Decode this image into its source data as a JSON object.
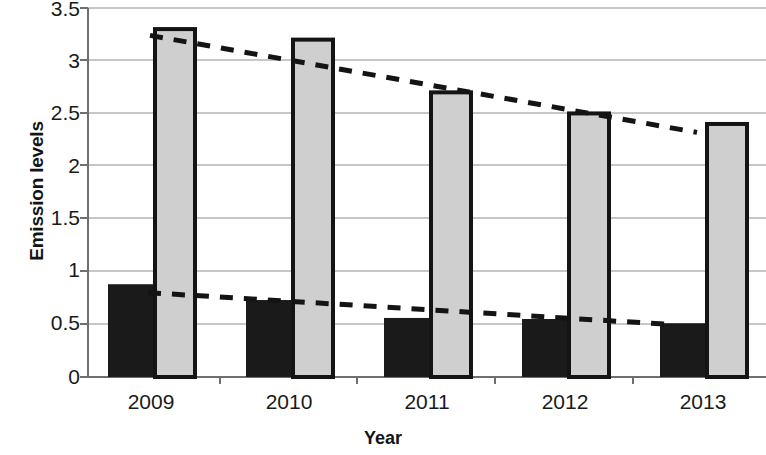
{
  "chart_data": {
    "type": "bar",
    "title": "",
    "subtitle": "",
    "xlabel": "Year",
    "ylabel": "Emission levels",
    "categories": [
      "2009",
      "2010",
      "2011",
      "2012",
      "2013"
    ],
    "series": [
      {
        "name": "series-1-black",
        "color": "#1a1a1a",
        "values": [
          0.88,
          0.73,
          0.56,
          0.55,
          0.51
        ]
      },
      {
        "name": "series-2-gray",
        "color": "#cfcfcf",
        "values": [
          3.3,
          3.2,
          2.7,
          2.5,
          2.4
        ]
      }
    ],
    "trendlines": [
      {
        "name": "trendline-gray",
        "style": "dashed",
        "color": "#141414",
        "start": 3.24,
        "end": 2.32
      },
      {
        "name": "trendline-black",
        "style": "dashed",
        "color": "#141414",
        "start": 0.8,
        "end": 0.5
      }
    ],
    "ylim": [
      0,
      3.5
    ],
    "ytick_labels": [
      "0",
      "0.5",
      "1",
      "1.5",
      "2",
      "2.5",
      "3",
      "3.5"
    ],
    "ytick_values": [
      0,
      0.5,
      1,
      1.5,
      2,
      2.5,
      3,
      3.5
    ],
    "grid": true,
    "legend": "none",
    "legend_position": "none"
  }
}
